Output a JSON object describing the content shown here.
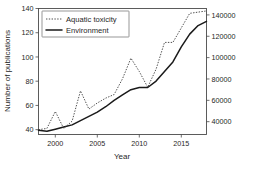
{
  "chart_data": {
    "type": "line",
    "title": "",
    "xlabel": "Year",
    "ylabel": "Number of publications",
    "ylabel_right": "",
    "xlim": [
      1998,
      2018
    ],
    "ylim": [
      36,
      140
    ],
    "ylim_right": [
      28000,
      146000
    ],
    "grid": false,
    "legend_position": "top-left",
    "xticks": [
      2000,
      2005,
      2010,
      2015
    ],
    "xtick_labels": [
      "2000",
      "2005",
      "2010",
      "2015"
    ],
    "yticks": [
      40,
      60,
      80,
      100,
      120,
      140
    ],
    "ytick_labels": [
      "40",
      "60",
      "80",
      "100",
      "120",
      "140"
    ],
    "yticks_right": [
      40000,
      60000,
      80000,
      100000,
      120000,
      140000
    ],
    "ytick_labels_right": [
      "40000",
      "60000",
      "80000",
      "100000",
      "120000",
      "140000"
    ],
    "x": [
      1998,
      1999,
      2000,
      2001,
      2002,
      2003,
      2004,
      2005,
      2006,
      2007,
      2008,
      2009,
      2010,
      2011,
      2012,
      2013,
      2014,
      2015,
      2016,
      2017,
      2018
    ],
    "series": [
      {
        "name": "Aquatic toxicity",
        "axis": "left",
        "style": "dotted",
        "color": "#3a3a3a",
        "values": [
          40,
          41,
          55,
          41,
          47,
          72,
          57,
          62,
          66,
          69,
          82,
          99,
          88,
          75,
          90,
          112,
          112,
          124,
          136,
          137,
          138
        ]
      },
      {
        "name": "Environment",
        "axis": "right",
        "style": "solid",
        "color": "#1a1a1a",
        "values": [
          39,
          38,
          40,
          42,
          44,
          48,
          52,
          57,
          62,
          68,
          73,
          78,
          80,
          80,
          86,
          95,
          104,
          117,
          128,
          134,
          138
        ],
        "values_right": [
          32000,
          31000,
          33000,
          35000,
          37000,
          41000,
          45000,
          49000,
          54000,
          60000,
          65000,
          70000,
          72000,
          72000,
          78000,
          87000,
          96000,
          110000,
          122000,
          130000,
          134000
        ]
      }
    ],
    "legend": [
      {
        "label": "Aquatic toxicity",
        "style": "dotted"
      },
      {
        "label": "Environment",
        "style": "solid"
      }
    ]
  }
}
